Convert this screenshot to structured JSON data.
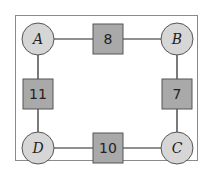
{
  "colors": {
    "node_fill": "#d6d6d6",
    "node_stroke": "#555555",
    "weight_fill": "#a9a9a9",
    "weight_stroke": "#555555",
    "edge": "#222222",
    "frame": "#8a8a8a"
  },
  "nodes": [
    {
      "id": "A",
      "label": "A",
      "cx": 38,
      "cy": 39
    },
    {
      "id": "B",
      "label": "B",
      "cx": 177,
      "cy": 39
    },
    {
      "id": "C",
      "label": "C",
      "cx": 177,
      "cy": 148
    },
    {
      "id": "D",
      "label": "D",
      "cx": 38,
      "cy": 148
    }
  ],
  "edges": [
    {
      "from": "A",
      "to": "B",
      "weight": "8"
    },
    {
      "from": "B",
      "to": "C",
      "weight": "7"
    },
    {
      "from": "C",
      "to": "D",
      "weight": "10"
    },
    {
      "from": "D",
      "to": "A",
      "weight": "11"
    }
  ]
}
